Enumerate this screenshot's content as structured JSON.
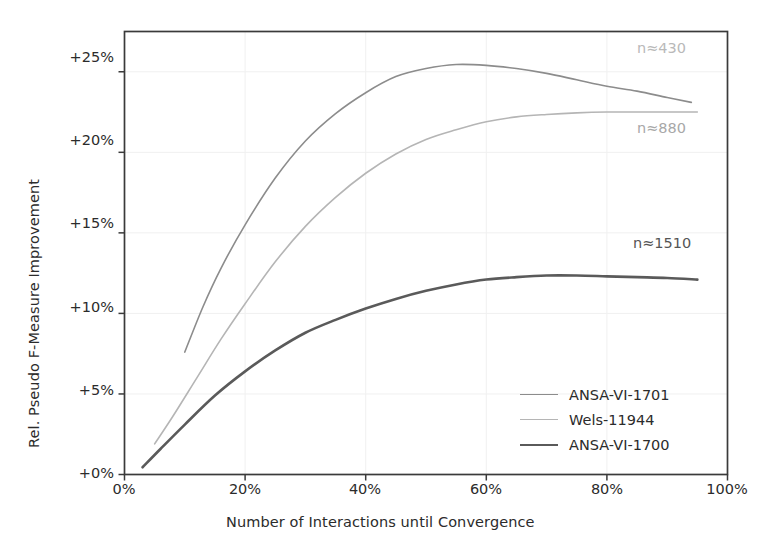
{
  "chart_data": {
    "type": "line",
    "title": "",
    "xlabel": "Number of Interactions until Convergence",
    "ylabel": "Rel. Pseudo F-Measure Improvement",
    "xlim": [
      0,
      100
    ],
    "ylim": [
      0,
      27.5
    ],
    "xticks": [
      "0%",
      "20%",
      "40%",
      "60%",
      "80%",
      "100%"
    ],
    "xtick_values": [
      0,
      20,
      40,
      60,
      80,
      100
    ],
    "yticks": [
      "+0%",
      "+5%",
      "+10%",
      "+15%",
      "+20%",
      "+25%"
    ],
    "ytick_values": [
      0,
      5,
      10,
      15,
      20,
      25
    ],
    "grid": true,
    "legend_position": "lower right",
    "series": [
      {
        "name": "ANSA-VI-1701",
        "color": "#8c8c8c",
        "width": 1.6,
        "annotation": "n≈430",
        "x": [
          10,
          13,
          16,
          20,
          25,
          30,
          35,
          40,
          45,
          50,
          55,
          60,
          65,
          70,
          75,
          80,
          85,
          90,
          94
        ],
        "y": [
          7.6,
          10.4,
          12.8,
          15.5,
          18.4,
          20.7,
          22.4,
          23.7,
          24.7,
          25.2,
          25.45,
          25.4,
          25.2,
          24.9,
          24.5,
          24.1,
          23.8,
          23.4,
          23.1
        ]
      },
      {
        "name": "Wels-11944",
        "color": "#b5b5b5",
        "width": 1.6,
        "annotation": "n≈880",
        "x": [
          5,
          8,
          12,
          16,
          20,
          25,
          30,
          35,
          40,
          45,
          50,
          55,
          60,
          65,
          70,
          75,
          80,
          85,
          90,
          95
        ],
        "y": [
          1.9,
          3.6,
          6.0,
          8.4,
          10.6,
          13.2,
          15.4,
          17.2,
          18.7,
          19.9,
          20.8,
          21.4,
          21.9,
          22.2,
          22.35,
          22.45,
          22.5,
          22.5,
          22.5,
          22.5
        ]
      },
      {
        "name": "ANSA-VI-1700",
        "color": "#5a5a5a",
        "width": 2.6,
        "annotation": "n≈1510",
        "x": [
          3,
          6,
          10,
          15,
          20,
          25,
          30,
          35,
          40,
          45,
          50,
          55,
          60,
          65,
          70,
          75,
          80,
          85,
          90,
          95
        ],
        "y": [
          0.45,
          1.6,
          3.1,
          4.9,
          6.4,
          7.7,
          8.8,
          9.6,
          10.3,
          10.9,
          11.4,
          11.8,
          12.1,
          12.25,
          12.35,
          12.35,
          12.3,
          12.25,
          12.2,
          12.1
        ]
      }
    ],
    "annotations": [
      {
        "text": "n≈430",
        "x": 85,
        "y": 26.0,
        "color": "#b9b9b9"
      },
      {
        "text": "n≈880",
        "x": 85,
        "y": 21.2,
        "color": "#a8a8a8"
      },
      {
        "text": "n≈1510",
        "x": 85,
        "y": 13.9,
        "color": "#555555"
      }
    ]
  },
  "legend": {
    "items": [
      {
        "label": "ANSA-VI-1701",
        "color": "#8c8c8c",
        "width": 1.6
      },
      {
        "label": "Wels-11944",
        "color": "#b5b5b5",
        "width": 1.6
      },
      {
        "label": "ANSA-VI-1700",
        "color": "#5a5a5a",
        "width": 2.6
      }
    ]
  },
  "axes": {
    "frame_color": "#3a3a3a",
    "grid_color": "#f0f0f0",
    "background": "#ffffff"
  }
}
